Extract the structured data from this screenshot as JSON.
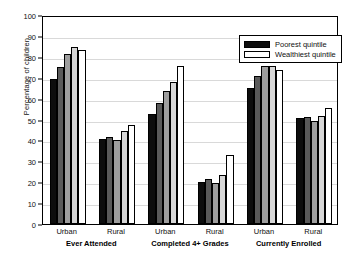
{
  "chart_data": {
    "type": "bar",
    "title": "",
    "xlabel": "",
    "ylabel": "Percentage of children",
    "ylim": [
      0,
      100
    ],
    "ytick_labels": [
      "0",
      "10",
      "20",
      "30",
      "40",
      "50",
      "60",
      "70",
      "80",
      "90",
      "100"
    ],
    "ytick_values": [
      0,
      10,
      20,
      30,
      40,
      50,
      60,
      70,
      80,
      90,
      100
    ],
    "grid": true,
    "legend_position": "top-right",
    "legend": [
      "Poorest quintile",
      "Wealthiest quintile"
    ],
    "series": [
      {
        "name": "Poorest quintile",
        "values": [
          69.5,
          40.5,
          52.5,
          20.0,
          65.0,
          50.5
        ]
      },
      {
        "name": "Second quintile",
        "values": [
          75.0,
          41.5,
          58.0,
          21.5,
          71.0,
          51.0
        ]
      },
      {
        "name": "Middle quintile",
        "values": [
          81.5,
          40.0,
          63.5,
          19.5,
          75.5,
          49.5
        ]
      },
      {
        "name": "Fourth quintile",
        "values": [
          84.5,
          44.5,
          68.0,
          23.5,
          75.5,
          51.5
        ]
      },
      {
        "name": "Wealthiest quintile",
        "values": [
          83.5,
          47.5,
          75.5,
          33.0,
          73.5,
          55.5
        ]
      }
    ],
    "categories": [
      "Urban",
      "Rural",
      "Urban",
      "Rural",
      "Urban",
      "Rural"
    ],
    "groups": [
      {
        "label": "Ever Attended",
        "categories": [
          "Urban",
          "Rural"
        ]
      },
      {
        "label": "Completed 4+ Grades",
        "categories": [
          "Urban",
          "Rural"
        ]
      },
      {
        "label": "Currently Enrolled",
        "categories": [
          "Urban",
          "Rural"
        ]
      }
    ],
    "bar_colors": [
      "#0d0d0d",
      "#5a5a5a",
      "#9e9e9e",
      "#d6d6d6",
      "#ffffff"
    ]
  },
  "legend": {
    "poorest_label": "Poorest quintile",
    "wealthiest_label": "Wealthiest quintile",
    "poorest_color": "#0d0d0d",
    "wealthiest_color": "#ffffff"
  },
  "axis": {
    "ylabel": "Percentage of children"
  },
  "xaxis": {
    "ticks": [
      "Urban",
      "Rural",
      "Urban",
      "Rural",
      "Urban",
      "Rural"
    ],
    "group_labels": [
      "Ever Attended",
      "Completed 4+ Grades",
      "Currently Enrolled"
    ]
  }
}
